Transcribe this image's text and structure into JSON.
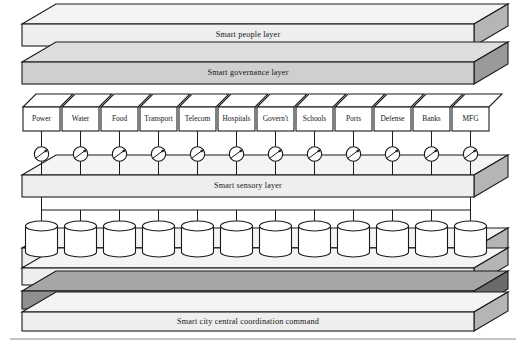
{
  "figure": {
    "background_color": "#ffffff"
  },
  "palette": {
    "outline": "#1a1a1a",
    "slab_light": "#eeeeee",
    "slab_light_top": "#f4f4f4",
    "slab_light_side": "#b5b5b5",
    "slab_mid": "#cfcfcf",
    "slab_mid_top": "#dedede",
    "slab_mid_side": "#9a9a9a",
    "slab_dark": "#8f8f8f",
    "slab_dark_top": "#a6a6a6",
    "slab_dark_side": "#6b6b6b",
    "box_fill": "#ffffff",
    "rule": "#8d8d8d"
  },
  "layers": [
    {
      "id": "smart-people-layer",
      "label": "Smart people layer",
      "tone": "light",
      "y": 24,
      "height": 22,
      "x": 22,
      "width": 452,
      "depth_x": 34,
      "depth_y": 20
    },
    {
      "id": "smart-governance-layer",
      "label": "Smart governance layer",
      "tone": "mid",
      "y": 62,
      "height": 22,
      "x": 22,
      "width": 452,
      "depth_x": 34,
      "depth_y": 20
    },
    {
      "id": "smart-sensory-layer",
      "label": "Smart sensory layer",
      "tone": "light",
      "y": 175,
      "height": 22,
      "x": 22,
      "width": 452,
      "depth_x": 34,
      "depth_y": 20
    },
    {
      "id": "city-big-data-layer",
      "label": "City Big Data",
      "tone": "light",
      "y": 248,
      "height": 19,
      "x": 22,
      "width": 452,
      "depth_x": 34,
      "depth_y": 20
    },
    {
      "id": "cognitive-security-layer",
      "label": "Cognitive and smart security layer",
      "tone": "light",
      "y": 268,
      "height": 17,
      "x": 22,
      "width": 452,
      "depth_x": 34,
      "depth_y": 20
    },
    {
      "id": "knowledge-predictive-layer",
      "label": "Knowledge and predictive analysis layer",
      "tone": "dark",
      "y": 291,
      "height": 18,
      "x": 22,
      "width": 452,
      "depth_x": 34,
      "depth_y": 20
    },
    {
      "id": "central-coordination-layer",
      "label": "Smart city central coordination command",
      "tone": "light",
      "y": 312,
      "height": 19,
      "x": 22,
      "width": 452,
      "depth_x": 34,
      "depth_y": 20
    }
  ],
  "sectors": {
    "row_y": 107,
    "row_height": 24,
    "x_start": 22,
    "x_end": 490,
    "items": [
      {
        "label": "Power"
      },
      {
        "label": "Water"
      },
      {
        "label": "Food"
      },
      {
        "label": "Transport"
      },
      {
        "label": "Telecom"
      },
      {
        "label": "Hospitals"
      },
      {
        "label": "Govern't"
      },
      {
        "label": "Schools"
      },
      {
        "label": "Ports"
      },
      {
        "label": "Defense"
      },
      {
        "label": "Banks"
      },
      {
        "label": "MFG"
      }
    ]
  },
  "gauges": {
    "count": 12,
    "center_y": 154,
    "radius": 7.2,
    "icon_name": "gauge-meter-icon",
    "description": "Sensor/meter gauge with diagonal needle"
  },
  "databases": {
    "count": 12,
    "icon_name": "database-cylinder-icon",
    "top_y": 226,
    "bottom_y": 252,
    "width": 32,
    "bus_y": 210
  },
  "bottom_rule": {
    "y": 339,
    "x_start": 10,
    "x_end": 516
  }
}
